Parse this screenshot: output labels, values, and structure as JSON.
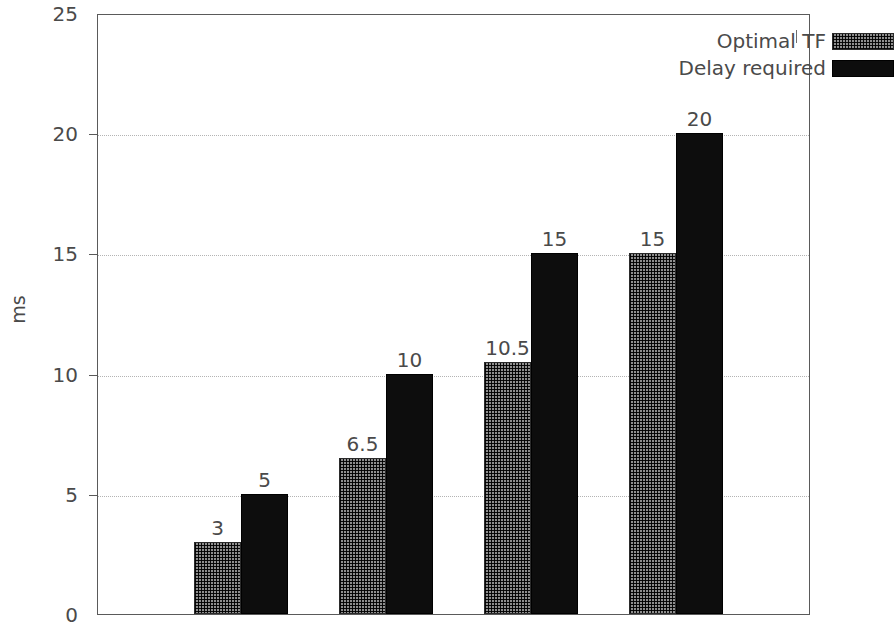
{
  "chart_data": {
    "type": "bar",
    "title": "",
    "xlabel": "",
    "ylabel": "ms",
    "ylim": [
      0,
      25
    ],
    "yticks": [
      0,
      5,
      10,
      15,
      20,
      25
    ],
    "ytick_labels": [
      "0",
      "5",
      "10",
      "15",
      "20",
      "25"
    ],
    "grid": "horizontal-dotted",
    "legend_position": "top-right-inside",
    "categories": [
      "1",
      "2",
      "3",
      "4"
    ],
    "series": [
      {
        "name": "Optimal TF",
        "style": "checkered-pattern",
        "color": "#8f8f8f",
        "values": [
          3,
          6.5,
          10.5,
          15
        ],
        "labels": [
          "3",
          "6.5",
          "10.5",
          "15"
        ]
      },
      {
        "name": "Delay required",
        "style": "solid-black",
        "color": "#0d0d0d",
        "values": [
          5,
          10,
          15,
          20
        ],
        "labels": [
          "5",
          "10",
          "15",
          "20"
        ]
      }
    ]
  },
  "legend": {
    "items": [
      {
        "label": "Optimal TF",
        "swatch": "pattern"
      },
      {
        "label": "Delay required",
        "swatch": "solid"
      }
    ]
  },
  "axis": {
    "y_title": "ms"
  }
}
